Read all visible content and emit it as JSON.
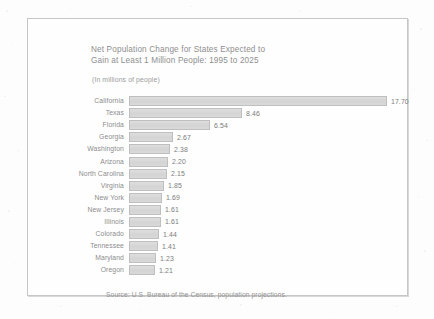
{
  "figure": {
    "title_line_1": "Net Population Change for States Expected to",
    "title_line_2": "Gain at Least 1 Million People:  1995 to 2025",
    "subtitle": "(In millions of people)",
    "source": "Source:  U.S. Bureau of the Census, population projections.",
    "bar_color": "#d9d9d9",
    "bar_border_color": "#bfbfbf",
    "text_color": "#8d8d8d",
    "frame_color": "#c6c6c6",
    "background_color": "#fefefe"
  },
  "chart_data": {
    "type": "bar",
    "orientation": "horizontal",
    "title": "Net Population Change for States Expected to Gain at Least 1 Million People:  1995 to 2025",
    "subtitle": "(In millions of people)",
    "xlabel": "",
    "ylabel": "",
    "unit": "millions of people",
    "grid": false,
    "legend": false,
    "xlim": [
      0,
      17.7
    ],
    "source": "Source:  U.S. Bureau of the Census, population projections.",
    "categories": [
      "California",
      "Texas",
      "Florida",
      "Georgia",
      "Washington",
      "Arizona",
      "North Carolina",
      "Virginia",
      "New York",
      "New Jersey",
      "Illinois",
      "Colorado",
      "Tennessee",
      "Maryland",
      "Oregon"
    ],
    "values": [
      17.7,
      8.46,
      6.54,
      2.67,
      2.38,
      2.2,
      2.15,
      1.85,
      1.69,
      1.61,
      1.61,
      1.44,
      1.41,
      1.23,
      1.21
    ],
    "value_labels": [
      "17.70",
      "8.46",
      "6.54",
      "2.67",
      "2.38",
      "2.20",
      "2.15",
      "1.85",
      "1.69",
      "1.61",
      "1.61",
      "1.44",
      "1.41",
      "1.23",
      "1.21"
    ],
    "bar_pixel_widths": [
      258,
      113,
      81,
      44,
      41,
      39,
      38,
      35,
      33,
      32,
      32,
      30,
      29,
      27,
      26
    ]
  }
}
